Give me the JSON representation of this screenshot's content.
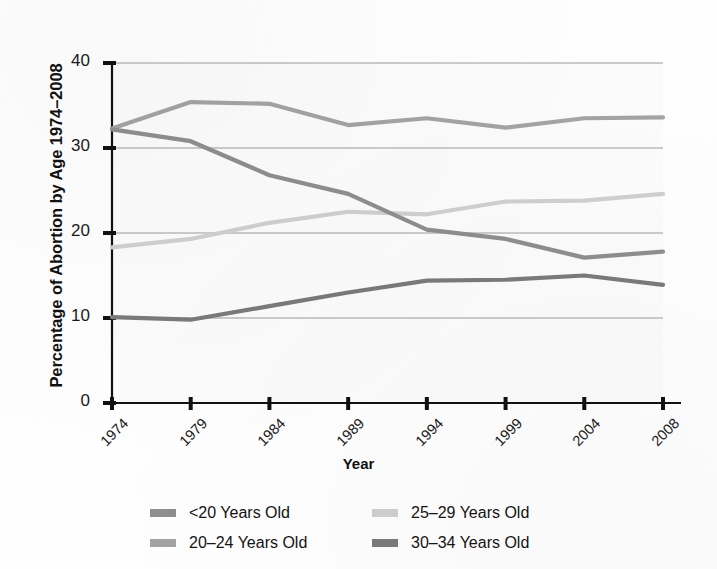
{
  "chart_data": {
    "type": "line",
    "title": "",
    "xlabel": "Year",
    "ylabel": "Percentage of Abortion by Age 1974–2008",
    "x": [
      1974,
      1979,
      1984,
      1989,
      1994,
      1999,
      2004,
      2008
    ],
    "xtick_labels": [
      "1974",
      "1979",
      "1984",
      "1989",
      "1994",
      "1999",
      "2004",
      "2008"
    ],
    "ytick_labels": [
      "0",
      "10",
      "20",
      "30",
      "40"
    ],
    "yticks": [
      0,
      10,
      20,
      30,
      40
    ],
    "ylim": [
      0,
      40
    ],
    "grid": "horizontal",
    "legend_position": "below-axes",
    "series": [
      {
        "name": "<20 Years Old",
        "color": "#8e8e8e",
        "values": [
          32.2,
          30.8,
          26.8,
          24.6,
          20.4,
          19.3,
          17.1,
          17.8
        ]
      },
      {
        "name": "20–24 Years Old",
        "color": "#a3a3a3",
        "values": [
          32.3,
          35.4,
          35.2,
          32.7,
          33.5,
          32.4,
          33.5,
          33.6
        ]
      },
      {
        "name": "25–29 Years Old",
        "color": "#cfcfcf",
        "values": [
          18.3,
          19.3,
          21.2,
          22.5,
          22.2,
          23.7,
          23.8,
          24.6
        ]
      },
      {
        "name": "30–34 Years Old",
        "color": "#7a7a7a",
        "values": [
          10.1,
          9.8,
          11.4,
          13.0,
          14.4,
          14.5,
          15.0,
          13.9
        ]
      }
    ],
    "legend": [
      {
        "label": "<20 Years Old",
        "color": "#8e8e8e"
      },
      {
        "label": "25–29 Years Old",
        "color": "#cfcfcf"
      },
      {
        "label": "20–24 Years Old",
        "color": "#a3a3a3"
      },
      {
        "label": "30–34 Years Old",
        "color": "#7a7a7a"
      }
    ],
    "axis_color": "#111111",
    "grid_color": "#9a9a9a",
    "plot_background": "#fbfbfb"
  }
}
